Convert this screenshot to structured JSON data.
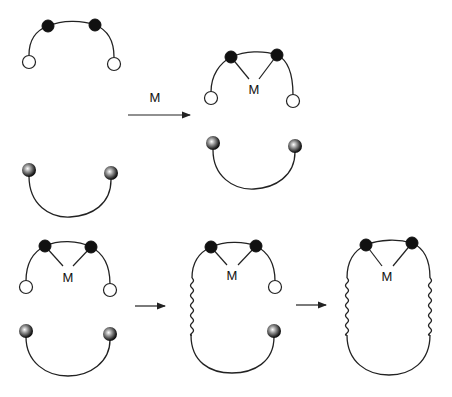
{
  "diagram": {
    "title": "",
    "reagent_label": "M",
    "metal_label": "M",
    "steps": [
      {
        "id": "step1",
        "description": "Open-chain ligand with two binding sites (black) and two open-circle ends, plus U-shaped linker with two shaded-ball ends",
        "arrow_label": "M"
      },
      {
        "id": "step2",
        "description": "Metal M coordinated to the two black binding sites; separate U-shaped linker"
      },
      {
        "id": "step3",
        "description": "First coupling: one end joined via wavy linkage",
        "arrow_label": ""
      },
      {
        "id": "step4",
        "description": "Second coupling forms closed macrocycle with two wavy linkages around M",
        "arrow_label": ""
      }
    ],
    "legend": {
      "open_circle": "reactive end group",
      "black_dot": "metal binding site",
      "shaded_ball": "complementary reactive end group",
      "wavy_line": "newly formed bond"
    },
    "colors": {
      "line": "#222222",
      "black_dot": "#111111",
      "background": "#ffffff"
    }
  }
}
